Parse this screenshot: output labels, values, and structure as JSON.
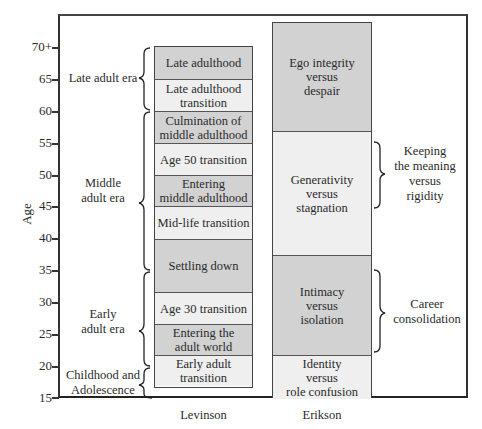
{
  "axis": {
    "title": "Age",
    "ticks": [
      "70+",
      "65",
      "60",
      "55",
      "50",
      "45",
      "40",
      "35",
      "30",
      "25",
      "20",
      "15"
    ]
  },
  "eras": [
    {
      "label_line1": "Late adult era",
      "label_line2": "",
      "from": 60,
      "to": 70
    },
    {
      "label_line1": "Middle",
      "label_line2": "adult era",
      "from": 35,
      "to": 60
    },
    {
      "label_line1": "Early",
      "label_line2": "adult era",
      "from": 20,
      "to": 35
    },
    {
      "label_line1": "Childhood and",
      "label_line2": "Adolescence",
      "from": 15,
      "to": 20
    }
  ],
  "levinson": {
    "label": "Levinson",
    "stages": [
      {
        "line1": "Late adulthood",
        "line2": "",
        "from": 65,
        "to": 70,
        "shade": "dark"
      },
      {
        "line1": "Late adulthood",
        "line2": "transition",
        "from": 60,
        "to": 65,
        "shade": "light"
      },
      {
        "line1": "Culmination of",
        "line2": "middle adulthood",
        "from": 55,
        "to": 60,
        "shade": "dark"
      },
      {
        "line1": "Age 50 transition",
        "line2": "",
        "from": 50,
        "to": 55,
        "shade": "light"
      },
      {
        "line1": "Entering",
        "line2": "middle adulthood",
        "from": 45,
        "to": 50,
        "shade": "dark"
      },
      {
        "line1": "Mid-life transition",
        "line2": "",
        "from": 40,
        "to": 45,
        "shade": "light"
      },
      {
        "line1": "Settling down",
        "line2": "",
        "from": 33,
        "to": 40,
        "shade": "dark"
      },
      {
        "line1": "Age 30 transition",
        "line2": "",
        "from": 28,
        "to": 33,
        "shade": "light"
      },
      {
        "line1": "Entering the",
        "line2": "adult world",
        "from": 22,
        "to": 28,
        "shade": "dark"
      },
      {
        "line1": "Early adult",
        "line2": "transition",
        "from": 17,
        "to": 22,
        "shade": "light"
      }
    ]
  },
  "erikson": {
    "label": "Erikson",
    "stages": [
      {
        "line1": "Ego integrity",
        "line2": "versus",
        "line3": "despair",
        "shade": "dark"
      },
      {
        "line1": "Generativity",
        "line2": "versus",
        "line3": "stagnation",
        "shade": "light"
      },
      {
        "line1": "Intimacy",
        "line2": "versus",
        "line3": "isolation",
        "shade": "dark"
      },
      {
        "line1": "Identity",
        "line2": "versus",
        "line3": "role confusion",
        "shade": "light"
      }
    ]
  },
  "vaillant": [
    {
      "line1": "Keeping",
      "line2": "the meaning",
      "line3": "versus",
      "line4": "rigidity"
    },
    {
      "line1": "Career",
      "line2": "consolidation"
    }
  ],
  "colors": {
    "dark_fill": "#d2d2d2",
    "light_fill": "#efefef",
    "line": "#333333"
  }
}
